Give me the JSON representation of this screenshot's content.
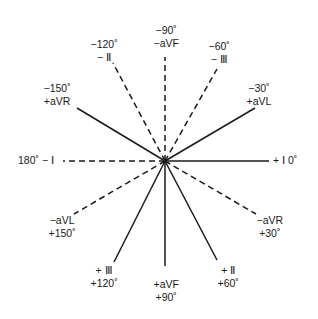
{
  "diagram": {
    "center": [
      165,
      161
    ],
    "line_color": "#1a1a1a",
    "axes": [
      {
        "angle": 0,
        "style": "solid",
        "end": [
          269,
          161
        ],
        "label_lines": [
          "+ Ⅰ  0˚"
        ],
        "label_pos": [
          273,
          154
        ],
        "align": "left"
      },
      {
        "angle": -30,
        "style": "solid",
        "end": [
          255,
          108
        ],
        "label_lines": [
          "−30˚",
          "+aVL"
        ],
        "label_pos": [
          259,
          82
        ],
        "align": "center"
      },
      {
        "angle": -60,
        "style": "dashed",
        "end": [
          217,
          69
        ],
        "label_lines": [
          "−60˚",
          "− Ⅲ"
        ],
        "label_pos": [
          219,
          40
        ],
        "align": "center"
      },
      {
        "angle": -90,
        "style": "dashed",
        "end": [
          165,
          57
        ],
        "label_lines": [
          "−90˚",
          "−aVF"
        ],
        "label_pos": [
          166,
          24
        ],
        "align": "center"
      },
      {
        "angle": -120,
        "style": "dashed",
        "end": [
          113,
          63
        ],
        "label_lines": [
          "−120˚",
          "− Ⅱ"
        ],
        "label_pos": [
          104,
          38
        ],
        "align": "center"
      },
      {
        "angle": -150,
        "style": "solid",
        "end": [
          77,
          108
        ],
        "label_lines": [
          "−150˚",
          "+aVR"
        ],
        "label_pos": [
          57,
          82
        ],
        "align": "center"
      },
      {
        "angle": 180,
        "style": "dashed",
        "end": [
          63,
          161
        ],
        "label_lines": [
          "180˚ − Ⅰ"
        ],
        "label_pos": [
          18,
          154
        ],
        "align": "left"
      },
      {
        "angle": 150,
        "style": "dashed",
        "end": [
          74,
          214
        ],
        "label_lines": [
          "−aVL",
          "+150˚"
        ],
        "label_pos": [
          62,
          214
        ],
        "align": "center"
      },
      {
        "angle": 120,
        "style": "solid",
        "end": [
          114,
          262
        ],
        "label_lines": [
          "+ Ⅲ",
          "+120˚"
        ],
        "label_pos": [
          104,
          264
        ],
        "align": "center"
      },
      {
        "angle": 90,
        "style": "solid",
        "end": [
          165,
          266
        ],
        "label_lines": [
          "+aVF",
          "+90˚"
        ],
        "label_pos": [
          166,
          278
        ],
        "align": "center"
      },
      {
        "angle": 60,
        "style": "solid",
        "end": [
          217,
          260
        ],
        "label_lines": [
          "+ Ⅱ",
          "+60˚"
        ],
        "label_pos": [
          228,
          264
        ],
        "align": "center"
      },
      {
        "angle": 30,
        "style": "dashed",
        "end": [
          256,
          214
        ],
        "label_lines": [
          "−aVR",
          "+30˚"
        ],
        "label_pos": [
          270,
          214
        ],
        "align": "center"
      }
    ]
  }
}
